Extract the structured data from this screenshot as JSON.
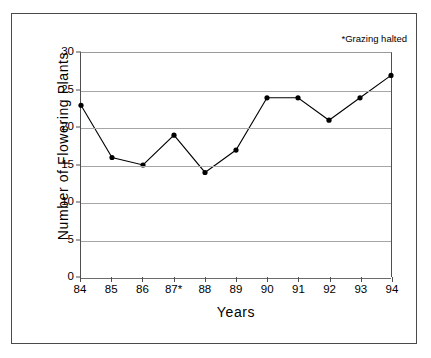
{
  "chart_data": {
    "type": "line",
    "title": "",
    "xlabel": "Years",
    "ylabel": "Number of Flowering Plants",
    "categories": [
      "84",
      "85",
      "86",
      "87*",
      "88",
      "89",
      "90",
      "91",
      "92",
      "93",
      "94"
    ],
    "values": [
      23,
      16,
      15,
      19,
      14,
      17,
      24,
      24,
      21,
      24,
      27
    ],
    "series": [
      {
        "name": "Number of Flowering Plants",
        "values": [
          23,
          16,
          15,
          19,
          14,
          17,
          24,
          24,
          21,
          24,
          27
        ]
      }
    ],
    "xlim": [
      0,
      10
    ],
    "ylim": [
      0,
      30
    ],
    "yticks": [
      0,
      5,
      10,
      15,
      20,
      25,
      30
    ],
    "ytick_labels": [
      "0",
      "5",
      "10",
      "15",
      "20",
      "25",
      "30"
    ],
    "xtick_labels": [
      "84",
      "85",
      "86",
      "87*",
      "88",
      "89",
      "90",
      "91",
      "92",
      "93",
      "94"
    ],
    "grid": "horizontal",
    "legend": "none",
    "annotations": [
      {
        "text": "*Grazing halted",
        "position": "top-right"
      }
    ],
    "marker": "filled-circle",
    "line_color": "#000000",
    "marker_color": "#000000",
    "grid_color": "#a6a6a6",
    "axis_color": "#4f4f4f",
    "background_color": "#ffffff"
  },
  "annotation": {
    "grazing_note": "*Grazing halted"
  },
  "axes": {
    "x_title": "Years",
    "y_title": "Number of Flowering Plants"
  }
}
